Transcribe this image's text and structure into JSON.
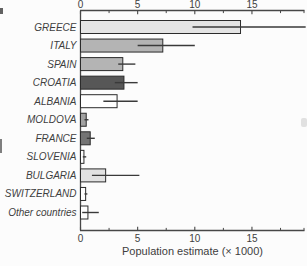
{
  "chart_data": {
    "type": "bar",
    "orientation": "horizontal",
    "title": "",
    "xlabel": "Population estimate (× 1000)",
    "ylabel": "",
    "xlim": [
      0,
      19.6
    ],
    "x_major_ticks": [
      0,
      5,
      10,
      15
    ],
    "x_minor_ticks": [
      2.5,
      7.5,
      12.5,
      17.5,
      19.56
    ],
    "grid": false,
    "legend": false,
    "categories": [
      "GREECE",
      "ITALY",
      "SPAIN",
      "CROATIA",
      "ALBANIA",
      "MOLDOVA",
      "FRANCE",
      "SLOVENIA",
      "BULGARIA",
      "SWITZERLAND",
      "Other countries"
    ],
    "values": [
      14.0,
      7.2,
      3.7,
      3.8,
      3.2,
      0.5,
      0.85,
      0.3,
      2.2,
      0.45,
      0.65
    ],
    "error_low": [
      9.8,
      5.0,
      3.3,
      3.0,
      2.0,
      0.35,
      0.55,
      0.2,
      1.0,
      0.35,
      0.15
    ],
    "error_high": [
      19.7,
      10.0,
      4.8,
      5.0,
      5.0,
      0.7,
      1.25,
      0.5,
      5.15,
      0.6,
      1.6
    ],
    "bar_fill_colors": [
      "#e4e4e4",
      "#b4b4b4",
      "#b4b4b4",
      "#575757",
      "#fefefe",
      "#a2a2a2",
      "#747474",
      "#fefefe",
      "#e2e2e2",
      "#fefefe",
      "#fefefe"
    ],
    "bar_edge_color": "#2b2b2b",
    "error_bar_color": "#3a3a3a",
    "axis_color": "#474747",
    "text_color": "#3e3e3e"
  }
}
